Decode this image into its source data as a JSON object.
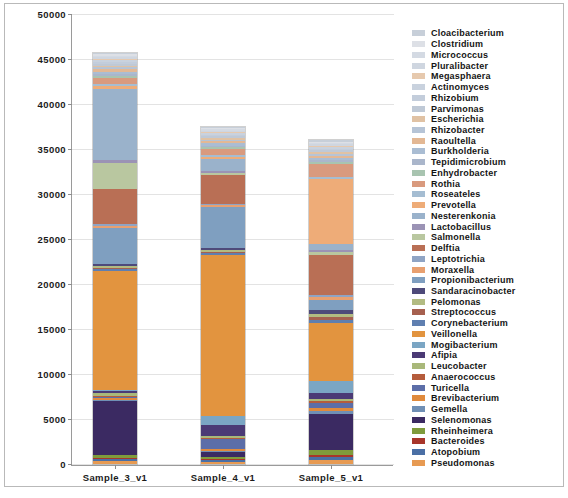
{
  "chart_data": {
    "type": "bar",
    "stacked": true,
    "title": "",
    "xlabel": "",
    "ylabel": "",
    "categories": [
      "Sample_3_v1",
      "Sample_4_v1",
      "Sample_5_v1"
    ],
    "ylim": [
      0,
      50000
    ],
    "yticks": [
      0,
      5000,
      10000,
      15000,
      20000,
      25000,
      30000,
      35000,
      40000,
      45000,
      50000
    ],
    "ytick_labels": [
      "0",
      "5000",
      "10000",
      "15000",
      "20000",
      "25000",
      "30000",
      "35000",
      "40000",
      "45000",
      "50000"
    ],
    "grid": true,
    "legend_position": "right",
    "totals": [
      45700,
      37500,
      36000
    ],
    "series": [
      {
        "name": "Pseudomonas",
        "color": "#e79a52",
        "values": [
          420,
          300,
          520
        ]
      },
      {
        "name": "Atopobium",
        "color": "#4a6fa5",
        "values": [
          180,
          160,
          330
        ]
      },
      {
        "name": "Bacteroides",
        "color": "#a8352a",
        "values": [
          160,
          150,
          300
        ]
      },
      {
        "name": "Rheinheimera",
        "color": "#7f9b3c",
        "values": [
          330,
          280,
          640
        ]
      },
      {
        "name": "Selenomonas",
        "color": "#3b2a62",
        "values": [
          6400,
          560,
          4700
        ]
      },
      {
        "name": "Gemella",
        "color": "#6f8fb5",
        "values": [
          150,
          140,
          430
        ]
      },
      {
        "name": "Brevibacterium",
        "color": "#e08a3c",
        "values": [
          240,
          210,
          360
        ]
      },
      {
        "name": "Turicella",
        "color": "#5c6ea8",
        "values": [
          170,
          1150,
          560
        ]
      },
      {
        "name": "Anaerococcus",
        "color": "#b55c3c",
        "values": [
          150,
          130,
          280
        ]
      },
      {
        "name": "Leucobacter",
        "color": "#a9b87a",
        "values": [
          330,
          260,
          330
        ]
      },
      {
        "name": "Afipia",
        "color": "#4b3a75",
        "values": [
          200,
          1300,
          740
        ]
      },
      {
        "name": "Mogibacterium",
        "color": "#7ba6c4",
        "values": [
          160,
          1080,
          1550
        ]
      },
      {
        "name": "Veillonella",
        "color": "#e2943f",
        "values": [
          14200,
          19300,
          7500
        ]
      },
      {
        "name": "Corynebacterium",
        "color": "#5f7fb0",
        "values": [
          190,
          240,
          420
        ]
      },
      {
        "name": "Streptococcus",
        "color": "#a6604f",
        "values": [
          170,
          200,
          360
        ]
      },
      {
        "name": "Pelomonas",
        "color": "#b2bb82",
        "values": [
          300,
          230,
          340
        ]
      },
      {
        "name": "Sandaracinobacter",
        "color": "#4e4a7a",
        "values": [
          200,
          170,
          560
        ]
      },
      {
        "name": "Propionibacterium",
        "color": "#7f9fc0",
        "values": [
          4300,
          4900,
          1250
        ]
      },
      {
        "name": "Moraxella",
        "color": "#e8a070",
        "values": [
          240,
          260,
          430
        ]
      },
      {
        "name": "Leptotrichia",
        "color": "#8fa4c4",
        "values": [
          180,
          200,
          300
        ]
      },
      {
        "name": "Delftia",
        "color": "#b96f55",
        "values": [
          4300,
          3400,
          5200
        ]
      },
      {
        "name": "Salmonella",
        "color": "#b9c7a0",
        "values": [
          3100,
          270,
          300
        ]
      },
      {
        "name": "Lactobacillus",
        "color": "#9b93b5",
        "values": [
          260,
          210,
          330
        ]
      },
      {
        "name": "Nesterenkonia",
        "color": "#9ab2cb",
        "values": [
          8600,
          1500,
          730
        ]
      },
      {
        "name": "Prevotella",
        "color": "#eeac78",
        "values": [
          300,
          260,
          8400
        ]
      },
      {
        "name": "Roseateles",
        "color": "#a5bdd2",
        "values": [
          260,
          240,
          330
        ]
      },
      {
        "name": "Rothia",
        "color": "#d99a7e",
        "values": [
          700,
          680,
          1600
        ]
      },
      {
        "name": "Enhydrobacter",
        "color": "#a8c4b0",
        "values": [
          230,
          200,
          280
        ]
      },
      {
        "name": "Tepidimicrobium",
        "color": "#aab6cb",
        "values": [
          220,
          200,
          250
        ]
      },
      {
        "name": "Burkholderia",
        "color": "#aabdd3",
        "values": [
          330,
          280,
          330
        ]
      },
      {
        "name": "Raoultella",
        "color": "#e3b894",
        "values": [
          250,
          230,
          270
        ]
      },
      {
        "name": "Rhizobacter",
        "color": "#b6c4d6",
        "values": [
          240,
          210,
          240
        ]
      },
      {
        "name": "Escherichia",
        "color": "#e0c2a4",
        "values": [
          230,
          200,
          230
        ]
      },
      {
        "name": "Parvimonas",
        "color": "#bfc9d6",
        "values": [
          220,
          190,
          220
        ]
      },
      {
        "name": "Rhizobium",
        "color": "#c3cddb",
        "values": [
          210,
          180,
          210
        ]
      },
      {
        "name": "Actinomyces",
        "color": "#c9d2de",
        "values": [
          200,
          175,
          200
        ]
      },
      {
        "name": "Megasphaera",
        "color": "#e6c9ae",
        "values": [
          190,
          170,
          190
        ]
      },
      {
        "name": "Pluralibacter",
        "color": "#cfd6e0",
        "values": [
          180,
          165,
          180
        ]
      },
      {
        "name": "Micrococcus",
        "color": "#d4dae3",
        "values": [
          175,
          160,
          175
        ]
      },
      {
        "name": "Clostridium",
        "color": "#dde0e6",
        "values": [
          170,
          155,
          170
        ]
      },
      {
        "name": "Cloacibacterium",
        "color": "#c7cfd9",
        "values": [
          165,
          150,
          165
        ]
      }
    ]
  },
  "legend": {
    "items": [
      "Cloacibacterium",
      "Clostridium",
      "Micrococcus",
      "Pluralibacter",
      "Megasphaera",
      "Actinomyces",
      "Rhizobium",
      "Parvimonas",
      "Escherichia",
      "Rhizobacter",
      "Raoultella",
      "Burkholderia",
      "Tepidimicrobium",
      "Enhydrobacter",
      "Rothia",
      "Roseateles",
      "Prevotella",
      "Nesterenkonia",
      "Lactobacillus",
      "Salmonella",
      "Delftia",
      "Leptotrichia",
      "Moraxella",
      "Propionibacterium",
      "Sandaracinobacter",
      "Pelomonas",
      "Streptococcus",
      "Corynebacterium",
      "Veillonella",
      "Mogibacterium",
      "Afipia",
      "Leucobacter",
      "Anaerococcus",
      "Turicella",
      "Brevibacterium",
      "Gemella",
      "Selenomonas",
      "Rheinheimera",
      "Bacteroides",
      "Atopobium",
      "Pseudomonas"
    ]
  }
}
